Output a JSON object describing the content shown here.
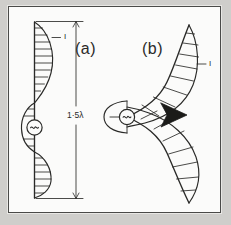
{
  "figure": {
    "background_color": "#cfcecb",
    "plate_color": "#fbfbfa",
    "ink_color": "#2a2a28",
    "frame_color": "#4a4a48",
    "panels": [
      {
        "id": "a",
        "label": "(a)",
        "description": "straight vertical antenna with hatched current distribution lobes",
        "current_label": "I",
        "feed_symbol": "~",
        "hatch_line_count": 16
      },
      {
        "id": "b",
        "label": "(b)",
        "description": "S-curved bent antenna with hatched current distribution lobes",
        "current_label": "I",
        "feed_symbol": "~",
        "hatch_line_count": 14,
        "direction_marker": "right-pointing-solid-triangle"
      }
    ],
    "dimension": {
      "text": "1·5λ",
      "orientation": "vertical",
      "applies_to": "a"
    }
  }
}
